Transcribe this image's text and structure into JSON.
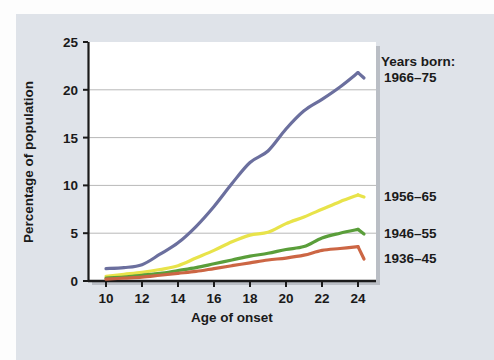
{
  "chart_data": {
    "type": "line",
    "title": "",
    "xlabel": "Age of onset",
    "ylabel": "Percentage of population",
    "xlim": [
      9,
      25
    ],
    "ylim": [
      0,
      25
    ],
    "xticks": [
      10,
      12,
      14,
      16,
      18,
      20,
      22,
      24
    ],
    "yticks": [
      0,
      5,
      10,
      15,
      20,
      25
    ],
    "grid": true,
    "gridlines_at": [
      5,
      10,
      15,
      20
    ],
    "legend_position": "right-inline",
    "legend_heading": "Years born:",
    "x": [
      10,
      11,
      12,
      13,
      14,
      15,
      16,
      17,
      18,
      19,
      20,
      21,
      22,
      23,
      24
    ],
    "series": [
      {
        "name": "1966–75",
        "color": "#6b6f9e",
        "values": [
          1.3,
          1.4,
          1.7,
          2.8,
          4.0,
          5.7,
          7.8,
          10.2,
          12.4,
          13.6,
          15.9,
          17.8,
          19.0,
          20.3,
          21.8
        ]
      },
      {
        "name": "1956–65",
        "color": "#e8e34a",
        "values": [
          0.5,
          0.7,
          0.9,
          1.2,
          1.6,
          2.4,
          3.2,
          4.1,
          4.8,
          5.1,
          6.0,
          6.7,
          7.5,
          8.3,
          9.0
        ]
      },
      {
        "name": "1946–55",
        "color": "#5a9e3a",
        "values": [
          0.3,
          0.4,
          0.6,
          0.8,
          1.1,
          1.4,
          1.8,
          2.2,
          2.6,
          2.9,
          3.3,
          3.6,
          4.5,
          5.0,
          5.4
        ]
      },
      {
        "name": "1936–45",
        "color": "#cc6644",
        "values": [
          0.2,
          0.3,
          0.4,
          0.6,
          0.8,
          1.0,
          1.3,
          1.6,
          1.9,
          2.2,
          2.4,
          2.7,
          3.2,
          3.4,
          3.6
        ]
      }
    ]
  },
  "axes": {
    "xlabel": "Age of onset",
    "ylabel": "Percentage of population",
    "xticks": [
      "10",
      "12",
      "14",
      "16",
      "18",
      "20",
      "22",
      "24"
    ],
    "yticks": [
      "0",
      "5",
      "10",
      "15",
      "20",
      "25"
    ]
  },
  "legend": {
    "heading": "Years born:",
    "entries": [
      {
        "label": "1966–75",
        "color": "#6b6f9e"
      },
      {
        "label": "1956–65",
        "color": "#e8e34a"
      },
      {
        "label": "1946–55",
        "color": "#5a9e3a"
      },
      {
        "label": "1936–45",
        "color": "#cc6644"
      }
    ]
  },
  "colors": {
    "page_background": "#dfe3e9",
    "plot_background": "#ffffff",
    "axis": "#1a1a1a",
    "gridline": "#b8b8b8"
  }
}
